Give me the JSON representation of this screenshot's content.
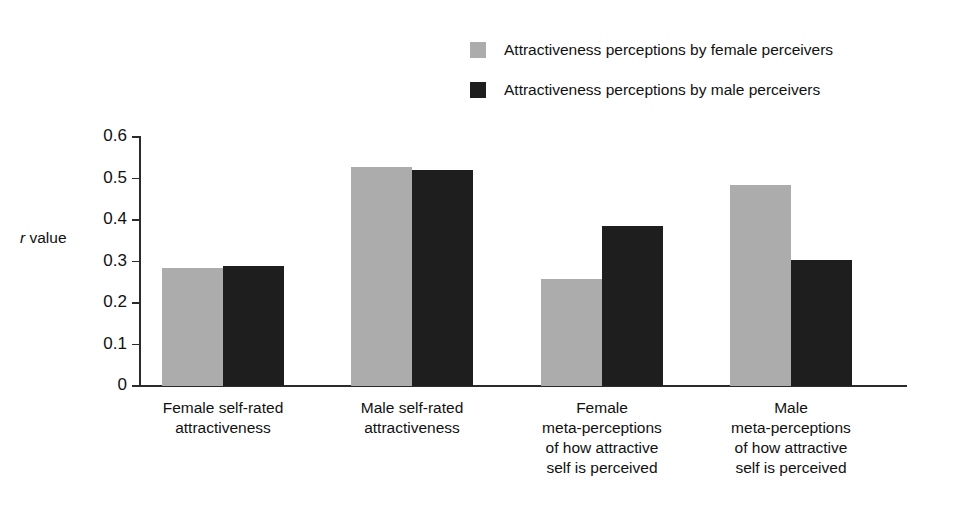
{
  "chart_data": {
    "type": "bar",
    "title": "",
    "xlabel": "",
    "ylabel": "r value",
    "ylim": [
      0,
      0.6
    ],
    "ytick_labels": [
      "0.6",
      "0.5",
      "0.4",
      "0.3",
      "0.2",
      "0.1",
      "0"
    ],
    "ytick_values": [
      0.6,
      0.5,
      0.4,
      0.3,
      0.2,
      0.1,
      0
    ],
    "grid": false,
    "legend_position": "top-right",
    "categories": [
      "Female self-rated attractiveness",
      "Male self-rated attractiveness",
      "Female meta-perceptions of how attractive self is perceived",
      "Male meta-perceptions of how attractive self is perceived"
    ],
    "category_lines": [
      [
        "Female self-rated",
        "attractiveness"
      ],
      [
        "Male self-rated",
        "attractiveness"
      ],
      [
        "Female",
        "meta-perceptions",
        "of how attractive",
        "self is perceived"
      ],
      [
        "Male",
        "meta-perceptions",
        "of how attractive",
        "self is perceived"
      ]
    ],
    "series": [
      {
        "name": "Attractiveness perceptions by female perceivers",
        "color": "#ACACAC",
        "values": [
          0.285,
          0.528,
          0.258,
          0.484
        ]
      },
      {
        "name": "Attractiveness perceptions by male perceivers",
        "color": "#1E1E1E",
        "values": [
          0.29,
          0.521,
          0.385,
          0.304
        ]
      }
    ]
  },
  "legend": {
    "items": [
      {
        "label": "Attractiveness perceptions by female perceivers",
        "color": "#ACACAC"
      },
      {
        "label": "Attractiveness perceptions by male perceivers",
        "color": "#1E1E1E"
      }
    ]
  },
  "axis": {
    "y_title_italic": "r",
    "y_title_rest": " value"
  }
}
